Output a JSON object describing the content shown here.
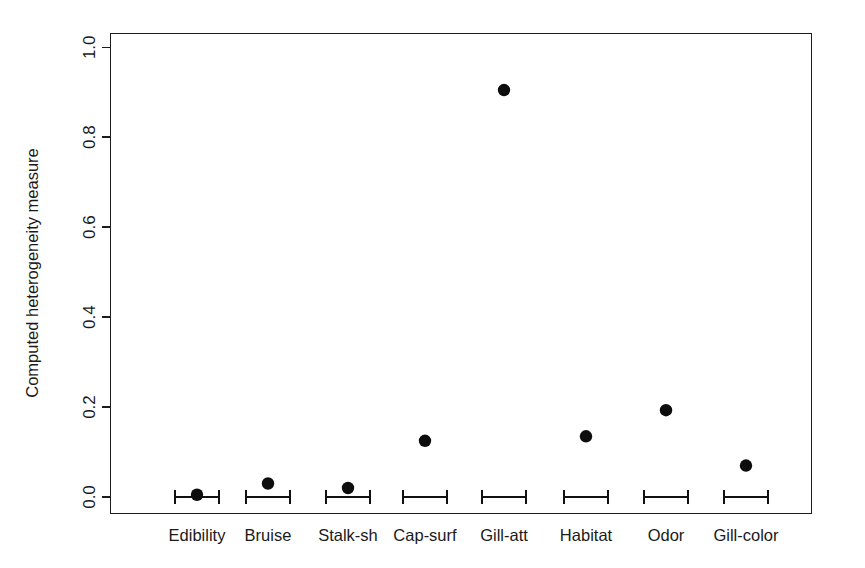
{
  "chart_data": {
    "type": "scatter",
    "title": "",
    "subtitle": "",
    "xlabel": "",
    "ylabel": "Computed heterogeneity measure",
    "categories": [
      "Edibility",
      "Bruise",
      "Stalk-sh",
      "Cap-surf",
      "Gill-att",
      "Habitat",
      "Odor",
      "Gill-color"
    ],
    "values": [
      0.005,
      0.03,
      0.02,
      0.125,
      0.905,
      0.135,
      0.193,
      0.07
    ],
    "errorbars": [
      {
        "category": "Edibility",
        "center": 0.0,
        "low": -0.018,
        "high": 0.018
      },
      {
        "category": "Bruise",
        "center": 0.0,
        "low": -0.022,
        "high": 0.022
      },
      {
        "category": "Stalk-sh",
        "center": 0.0,
        "low": -0.022,
        "high": 0.022
      },
      {
        "category": "Cap-surf",
        "center": 0.0,
        "low": -0.022,
        "high": 0.022
      },
      {
        "category": "Gill-att",
        "center": 0.0,
        "low": -0.022,
        "high": 0.022
      },
      {
        "category": "Habitat",
        "center": 0.0,
        "low": -0.022,
        "high": 0.022
      },
      {
        "category": "Odor",
        "center": 0.0,
        "low": -0.022,
        "high": 0.022
      },
      {
        "category": "Gill-color",
        "center": 0.0,
        "low": -0.022,
        "high": 0.022
      }
    ],
    "ylim": [
      -0.038,
      1.038
    ],
    "yticks": [
      0.0,
      0.2,
      0.4,
      0.6,
      0.8,
      1.0
    ],
    "ytick_labels": [
      "0.0",
      "0.2",
      "0.4",
      "0.6",
      "0.8",
      "1.0"
    ],
    "grid": false,
    "legend": null,
    "marker": "filled-circle",
    "marker_color": "#0d0d0d",
    "box_frame": true
  },
  "axes": {
    "y_title": "Computed heterogeneity measure",
    "y_tick_labels": [
      "0.0",
      "0.2",
      "0.4",
      "0.6",
      "0.8",
      "1.0"
    ],
    "x_tick_labels": [
      "Edibility",
      "Bruise",
      "Stalk-sh",
      "Cap-surf",
      "Gill-att",
      "Habitat",
      "Odor",
      "Gill-color"
    ]
  },
  "colors": {
    "axis": "#1c1c1c",
    "marker": "#0d0d0d",
    "errorbar": "#111111",
    "background": "#ffffff"
  }
}
